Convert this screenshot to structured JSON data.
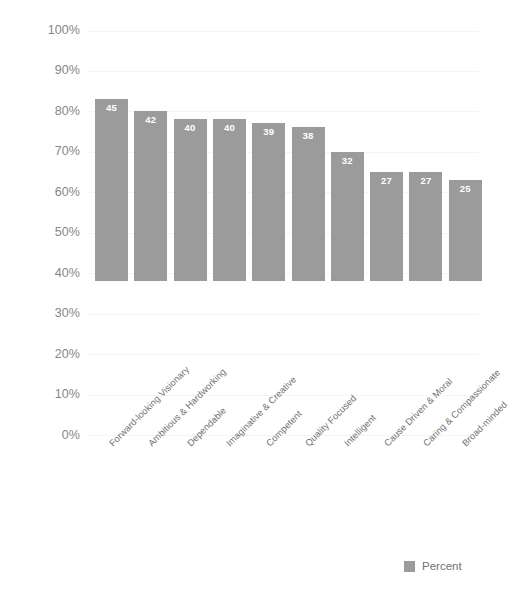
{
  "chart_data": {
    "type": "bar",
    "title": "",
    "subtitle": "",
    "xlabel": "",
    "ylabel": "",
    "ylim": [
      0,
      100
    ],
    "grid": true,
    "legend_position": "bottom-right",
    "categories": [
      "Forward-looking Visionary",
      "Ambitious & Hardworking",
      "Dependable",
      "Imaginative & Creative",
      "Competent",
      "Quality Focused",
      "Intelligent",
      "Cause Driven & Moral",
      "Caring & Compassionate",
      "Broad-minded"
    ],
    "values": [
      45,
      42,
      40,
      40,
      39,
      38,
      32,
      27,
      27,
      25
    ],
    "value_labels": [
      "45",
      "42",
      "40",
      "40",
      "39",
      "38",
      "32",
      "27",
      "27",
      "25"
    ],
    "yticks": [
      100,
      90,
      80,
      70,
      60,
      50,
      40,
      30,
      20,
      10,
      0
    ],
    "ytick_labels": [
      "100%",
      "90%",
      "80%",
      "70%",
      "60%",
      "50%",
      "40%",
      "30%",
      "20%",
      "10%",
      "0%"
    ],
    "series": [
      {
        "name": "Percent",
        "color": "#9b9b9b",
        "values": [
          45,
          42,
          40,
          40,
          39,
          38,
          32,
          27,
          27,
          25
        ]
      }
    ]
  },
  "legend": {
    "items": [
      {
        "label": "Percent",
        "color": "#9b9b9b"
      }
    ]
  },
  "colors": {
    "bar": "#9b9b9b",
    "axis_text": "#84868a",
    "category_text": "#6f7175",
    "value_text": "#ffffff",
    "gridline": "#f4f4f5",
    "background": "#ffffff"
  }
}
